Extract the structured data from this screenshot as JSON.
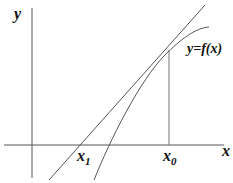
{
  "diagram": {
    "axes": {
      "x_label": "x",
      "y_label": "y"
    },
    "curve_label": "y=f(x)",
    "points": {
      "x0_label": "x",
      "x0_sub": "0",
      "x1_label": "x",
      "x1_sub": "1"
    },
    "colors": {
      "lines": "#555555",
      "text": "#111111",
      "background": "#ffffff"
    }
  }
}
